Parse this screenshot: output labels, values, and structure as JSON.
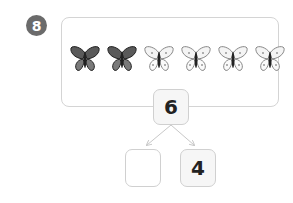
{
  "problem": {
    "number": "8",
    "butterflies": {
      "total": 6,
      "shaded_count": 2,
      "unshaded_count": 4,
      "items": [
        "shaded",
        "shaded",
        "outline",
        "outline",
        "outline",
        "outline"
      ]
    },
    "number_bond": {
      "whole": "6",
      "part_left": "",
      "part_right": "4"
    }
  },
  "colors": {
    "badge": "#6b6b6b",
    "border": "#d0d0d0",
    "shaded_wing": "#555555",
    "outline_wing": "#f2f2f2"
  }
}
